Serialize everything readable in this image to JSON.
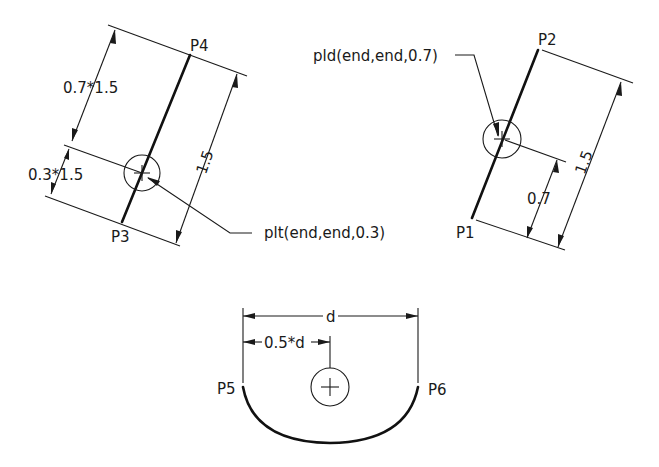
{
  "diagrams": {
    "left": {
      "start_label": "P3",
      "end_label": "P4",
      "total_dim": "1.5",
      "upper_dim": "0.7*1.5",
      "lower_dim": "0.3*1.5",
      "callout": "plt(end,end,0.3)"
    },
    "right": {
      "start_label": "P1",
      "end_label": "P2",
      "total_dim": "1.5",
      "partial_dim": "0.7",
      "callout": "pld(end,end,0.7)"
    },
    "bottom": {
      "start_label": "P5",
      "end_label": "P6",
      "total_dim": "d",
      "half_dim": "0.5*d"
    }
  },
  "colors": {
    "background": "#ffffff",
    "ink": "#1a1a1a"
  }
}
